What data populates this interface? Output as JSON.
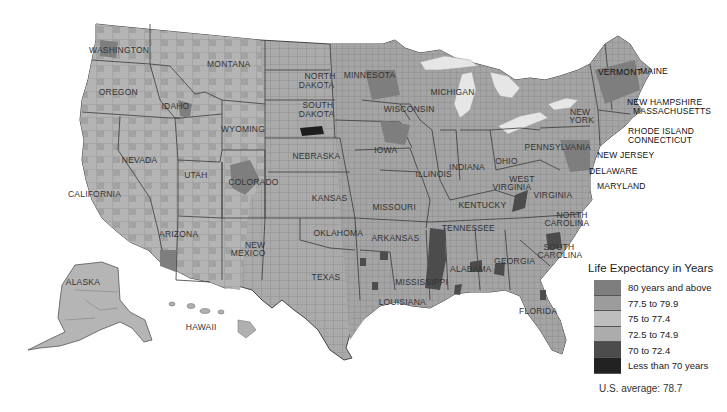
{
  "map": {
    "title": "Life Expectancy in Years",
    "type": "choropleth",
    "subject": "US county life expectancy",
    "colors": {
      "background": "#ffffff",
      "water": "#e6e6e6",
      "border": "#555555"
    },
    "state_labels": [
      {
        "name": "WASHINGTON",
        "x": 116,
        "y": 51
      },
      {
        "name": "MONTANA",
        "x": 226,
        "y": 65
      },
      {
        "name": "OREGON",
        "x": 115,
        "y": 93
      },
      {
        "name": "IDAHO",
        "x": 175,
        "y": 107
      },
      {
        "name": "WYOMING",
        "x": 240,
        "y": 130
      },
      {
        "name": "NORTH",
        "x": 318,
        "y": 77
      },
      {
        "name": "DAKOTA",
        "x": 315,
        "y": 86
      },
      {
        "name": "MINNESOTA",
        "x": 368,
        "y": 76
      },
      {
        "name": "SOUTH",
        "x": 316,
        "y": 106
      },
      {
        "name": "DAKOTA",
        "x": 315,
        "y": 115
      },
      {
        "name": "WISCONSIN",
        "x": 408,
        "y": 110
      },
      {
        "name": "MICHIGAN",
        "x": 452,
        "y": 93
      },
      {
        "name": "NEBRASKA",
        "x": 314,
        "y": 157
      },
      {
        "name": "IOWA",
        "x": 385,
        "y": 151
      },
      {
        "name": "NEVADA",
        "x": 138,
        "y": 161
      },
      {
        "name": "UTAH",
        "x": 195,
        "y": 176
      },
      {
        "name": "COLORADO",
        "x": 250,
        "y": 183
      },
      {
        "name": "CALIFORNIA",
        "x": 95,
        "y": 195
      },
      {
        "name": "KANSAS",
        "x": 328,
        "y": 199
      },
      {
        "name": "MISSOURI",
        "x": 394,
        "y": 208
      },
      {
        "name": "ILLINOIS",
        "x": 437,
        "y": 175
      },
      {
        "name": "INDIANA",
        "x": 468,
        "y": 168
      },
      {
        "name": "OHIO",
        "x": 506,
        "y": 162
      },
      {
        "name": "PENNSYLVANIA",
        "x": 557,
        "y": 148
      },
      {
        "name": "NEW",
        "x": 578,
        "y": 113
      },
      {
        "name": "YORK",
        "x": 580,
        "y": 121
      },
      {
        "name": "WEST",
        "x": 520,
        "y": 180
      },
      {
        "name": "VIRGINIA",
        "x": 514,
        "y": 188
      },
      {
        "name": "VIRGINIA",
        "x": 555,
        "y": 196
      },
      {
        "name": "KENTUCKY",
        "x": 480,
        "y": 206
      },
      {
        "name": "ARIZONA",
        "x": 178,
        "y": 235
      },
      {
        "name": "NEW",
        "x": 253,
        "y": 246
      },
      {
        "name": "MEXICO",
        "x": 247,
        "y": 254
      },
      {
        "name": "OKLAHOMA",
        "x": 335,
        "y": 234
      },
      {
        "name": "ARKANSAS",
        "x": 393,
        "y": 239
      },
      {
        "name": "TENNESSEE",
        "x": 466,
        "y": 229
      },
      {
        "name": "NORTH",
        "x": 570,
        "y": 216
      },
      {
        "name": "CAROLINA",
        "x": 566,
        "y": 224
      },
      {
        "name": "SOUTH",
        "x": 557,
        "y": 248
      },
      {
        "name": "CAROLINA",
        "x": 559,
        "y": 256
      },
      {
        "name": "GEORGIA",
        "x": 513,
        "y": 262
      },
      {
        "name": "ALABAMA",
        "x": 469,
        "y": 270
      },
      {
        "name": "MISSISSIPPI",
        "x": 425,
        "y": 283
      },
      {
        "name": "TEXAS",
        "x": 325,
        "y": 278
      },
      {
        "name": "LOUISIANA",
        "x": 403,
        "y": 303
      },
      {
        "name": "FLORIDA",
        "x": 538,
        "y": 312
      },
      {
        "name": "ALASKA",
        "x": 82,
        "y": 283
      },
      {
        "name": "HAWAII",
        "x": 202,
        "y": 328
      }
    ],
    "external_labels": [
      {
        "name": "VERMONT",
        "x": 598,
        "y": 73
      },
      {
        "name": "MAINE",
        "x": 640,
        "y": 72
      },
      {
        "name": "NEW HAMPSHIRE",
        "x": 627,
        "y": 103
      },
      {
        "name": "MASSACHUSETTS",
        "x": 633,
        "y": 112
      },
      {
        "name": "RHODE ISLAND",
        "x": 628,
        "y": 132
      },
      {
        "name": "CONNECTICUT",
        "x": 628,
        "y": 141
      },
      {
        "name": "NEW JERSEY",
        "x": 597,
        "y": 156
      },
      {
        "name": "DELAWARE",
        "x": 589,
        "y": 172
      },
      {
        "name": "MARYLAND",
        "x": 597,
        "y": 187
      }
    ]
  },
  "legend": {
    "title": "Life Expectancy in Years",
    "items": [
      {
        "label": "80 years and above",
        "color": "#7e7e7e"
      },
      {
        "label": "77.5 to 79.9",
        "color": "#9c9c9c"
      },
      {
        "label": "75 to 77.4",
        "color": "#bdbdbd"
      },
      {
        "label": "72.5 to 74.9",
        "color": "#acacac"
      },
      {
        "label": "70 to 72.4",
        "color": "#4c4c4c"
      },
      {
        "label": "Less than 70 years",
        "color": "#222222"
      }
    ]
  },
  "footer": {
    "us_average_label": "U.S. average:",
    "us_average_value": "78.7",
    "us_average_text": "U.S. average:  78.7"
  },
  "chart_data": {
    "type": "heatmap",
    "title": "Life Expectancy in Years",
    "subtitle": "",
    "xlabel": "",
    "ylabel": "",
    "legend_position": "bottom-right",
    "legend": [
      {
        "category": "80 years and above",
        "range": [
          80,
          null
        ]
      },
      {
        "category": "77.5 to 79.9",
        "range": [
          77.5,
          79.9
        ]
      },
      {
        "category": "75 to 77.4",
        "range": [
          75,
          77.4
        ]
      },
      {
        "category": "72.5 to 74.9",
        "range": [
          72.5,
          74.9
        ]
      },
      {
        "category": "70 to 72.4",
        "range": [
          70,
          72.4
        ]
      },
      {
        "category": "Less than 70 years",
        "range": [
          null,
          70
        ]
      }
    ],
    "annotations": [
      "U.S. average: 78.7"
    ],
    "notable_regions": [
      {
        "region": "South Dakota (southwest reservations)",
        "category": "Less than 70 years"
      },
      {
        "region": "Mississippi Delta",
        "category": "70 to 72.4"
      },
      {
        "region": "Eastern Kentucky / West Virginia",
        "category": "70 to 72.4"
      },
      {
        "region": "North/South Carolina interior",
        "category": "70 to 72.4"
      },
      {
        "region": "Alabama Black Belt",
        "category": "70 to 72.4"
      },
      {
        "region": "Colorado / Minnesota / Upper Midwest",
        "category": "80 years and above"
      }
    ]
  }
}
